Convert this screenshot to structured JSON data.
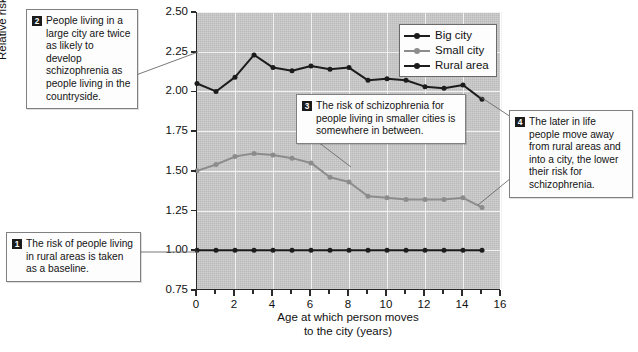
{
  "chart_data": {
    "type": "line",
    "title": "",
    "xlabel": "Age at which person moves to the city (years)",
    "xlabel_line1": "Age at which person moves",
    "xlabel_line2": "to the city (years)",
    "ylabel": "Relative risk of schizophrenia",
    "xlim": [
      0,
      16
    ],
    "ylim": [
      0.75,
      2.5
    ],
    "xticks": [
      0,
      2,
      4,
      6,
      8,
      10,
      12,
      14,
      16
    ],
    "xtick_labels": [
      "0",
      "2",
      "4",
      "6",
      "8",
      "10",
      "12",
      "14",
      "16"
    ],
    "xminor_ticks": [
      1,
      3,
      5,
      7,
      9,
      11,
      13,
      15
    ],
    "yticks": [
      0.75,
      1.0,
      1.25,
      1.5,
      1.75,
      2.0,
      2.25,
      2.5
    ],
    "ytick_labels": [
      "0.75",
      "1.00",
      "1.25",
      "1.50",
      "1.75",
      "2.00",
      "2.25",
      "2.50"
    ],
    "grid": true,
    "legend_position": "top-right",
    "x": [
      0,
      1,
      2,
      3,
      4,
      5,
      6,
      7,
      8,
      9,
      10,
      11,
      12,
      13,
      14,
      15
    ],
    "series": [
      {
        "name": "Big city",
        "color": "#1c1c1c",
        "values": [
          2.05,
          2.0,
          2.09,
          2.23,
          2.15,
          2.13,
          2.16,
          2.14,
          2.15,
          2.07,
          2.08,
          2.07,
          2.03,
          2.02,
          2.04,
          1.95
        ]
      },
      {
        "name": "Small city",
        "color": "#8c8c8c",
        "values": [
          1.5,
          1.54,
          1.59,
          1.61,
          1.6,
          1.58,
          1.55,
          1.46,
          1.43,
          1.34,
          1.33,
          1.32,
          1.32,
          1.32,
          1.33,
          1.27
        ]
      },
      {
        "name": "Rural area",
        "color": "#1c1c1c",
        "values": [
          1.0,
          1.0,
          1.0,
          1.0,
          1.0,
          1.0,
          1.0,
          1.0,
          1.0,
          1.0,
          1.0,
          1.0,
          1.0,
          1.0,
          1.0,
          1.0
        ]
      }
    ]
  },
  "legend": {
    "entries": [
      {
        "label": "Big city"
      },
      {
        "label": "Small city"
      },
      {
        "label": "Rural area"
      }
    ]
  },
  "callouts": [
    {
      "number": "1",
      "text": "The risk of people living in rural areas is taken as a baseline."
    },
    {
      "number": "2",
      "text": "People living in a large city are twice as likely to develop schizophrenia as people living in the countryside."
    },
    {
      "number": "3",
      "text": "The risk of schizophrenia for people living in smaller cities is somewhere in between."
    },
    {
      "number": "4",
      "text": "The later in life people move away from rural areas and into a city, the lower their risk for schizophrenia."
    }
  ]
}
